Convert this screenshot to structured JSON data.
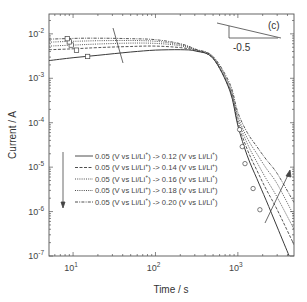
{
  "chart_data": {
    "type": "line",
    "panel_label": "(c)",
    "title": "",
    "xlabel": "Time / s",
    "ylabel": "Current / A",
    "xscale": "log",
    "yscale": "log",
    "xlim": [
      5.1,
      4800
    ],
    "ylim": [
      1e-07,
      0.028
    ],
    "grid": false,
    "x_ticks": [
      {
        "value": 10,
        "base": "10",
        "exp": "1"
      },
      {
        "value": 100,
        "base": "10",
        "exp": "2"
      },
      {
        "value": 1000,
        "base": "10",
        "exp": "3"
      }
    ],
    "y_ticks": [
      {
        "value": 0.01,
        "base": "10",
        "exp": "-2"
      },
      {
        "value": 0.001,
        "base": "10",
        "exp": "-3"
      },
      {
        "value": 0.0001,
        "base": "10",
        "exp": "-4"
      },
      {
        "value": 1e-05,
        "base": "10",
        "exp": "-5"
      },
      {
        "value": 1e-06,
        "base": "10",
        "exp": "-6"
      },
      {
        "value": 1e-07,
        "base": "10",
        "exp": "-7"
      }
    ],
    "slope_annotation": {
      "label": "-0.5"
    },
    "legend_position": "lower-left inside",
    "series": [
      {
        "name": "0.05 (V vs Li/Li+) -> 0.12 (V vs Li/Li+)",
        "style": "solid",
        "x": [
          5.1,
          10,
          20,
          50,
          100,
          200,
          310,
          500,
          800,
          1000,
          1300,
          1700,
          2200,
          3000,
          4200
        ],
        "y": [
          0.0025,
          0.0029,
          0.0033,
          0.0039,
          0.0043,
          0.0044,
          0.0041,
          0.0028,
          0.00052,
          8.5e-05,
          1.8e-05,
          5.5e-06,
          1.8e-06,
          4.5e-07,
          1e-07
        ],
        "marker_x": 15,
        "marker_y": 0.0031
      },
      {
        "name": "0.05 (V vs Li/Li+) -> 0.14 (V vs Li/Li+)",
        "style": "dashed",
        "x": [
          5.1,
          10,
          20,
          50,
          100,
          200,
          310,
          500,
          800,
          1000,
          1300,
          1700,
          2200,
          3000,
          4800
        ],
        "y": [
          0.0044,
          0.0046,
          0.0049,
          0.0052,
          0.0053,
          0.0049,
          0.0042,
          0.0028,
          0.00055,
          0.0001,
          2.5e-05,
          8.5e-06,
          3.2e-06,
          1.1e-06,
          1.8e-07
        ],
        "marker_x": 11,
        "marker_y": 0.0043
      },
      {
        "name": "0.05 (V vs Li/Li+) -> 0.16 (V vs Li/Li+)",
        "style": "dotted",
        "x": [
          5.1,
          10,
          20,
          50,
          100,
          200,
          310,
          500,
          800,
          1000,
          1300,
          1700,
          2200,
          3000,
          4800
        ],
        "y": [
          0.0053,
          0.0056,
          0.0059,
          0.0062,
          0.0061,
          0.0054,
          0.0043,
          0.0029,
          0.0006,
          0.00012,
          3.4e-05,
          1.3e-05,
          5.5e-06,
          2.1e-06,
          4e-07
        ],
        "marker_x": 9.5,
        "marker_y": 0.0056
      },
      {
        "name": "0.05 (V vs Li/Li+) -> 0.18 (V vs Li/Li+)",
        "style": "dotted",
        "x": [
          5.1,
          10,
          20,
          50,
          100,
          200,
          310,
          500,
          800,
          1000,
          1300,
          1700,
          2200,
          3000,
          4800
        ],
        "y": [
          0.0065,
          0.0068,
          0.007,
          0.0071,
          0.0068,
          0.0057,
          0.0044,
          0.003,
          0.00066,
          0.00014,
          4.5e-05,
          2e-05,
          9.5e-06,
          4.2e-06,
          8e-07
        ],
        "marker_x": 9,
        "marker_y": 0.0066
      },
      {
        "name": "0.05 (V vs Li/Li+) -> 0.20 (V vs Li/Li+)",
        "style": "dashdot",
        "x": [
          5.1,
          10,
          20,
          50,
          100,
          200,
          310,
          500,
          800,
          1000,
          1300,
          1700,
          2200,
          3000,
          4800
        ],
        "y": [
          0.0076,
          0.0079,
          0.008,
          0.0078,
          0.0074,
          0.006,
          0.0045,
          0.0031,
          0.00075,
          0.00017,
          6e-05,
          2.9e-05,
          1.5e-05,
          7.2e-06,
          1.6e-06
        ],
        "marker_x": 8.5,
        "marker_y": 0.0078
      }
    ],
    "tail_markers": [
      {
        "x": 1050,
        "y": 7e-05
      },
      {
        "x": 1130,
        "y": 2.9e-05
      },
      {
        "x": 1220,
        "y": 1.2e-05
      },
      {
        "x": 1530,
        "y": 3.3e-06
      },
      {
        "x": 1850,
        "y": 1.1e-06
      }
    ],
    "annotations": [
      {
        "type": "arrow",
        "meaning": "increasing final potential (legend order)",
        "direction": "down"
      },
      {
        "type": "arrow",
        "meaning": "increasing final potential (tail region)",
        "direction": "up-right"
      },
      {
        "type": "line",
        "meaning": "increasing final potential (plateau region)"
      }
    ]
  },
  "legend": {
    "entries": [
      {
        "from": "0.05 (V vs Li/Li",
        "sup": "+",
        "mid": ") -> 0.12 (V vs Li/Li",
        "sup2": "+",
        "end": ")"
      },
      {
        "from": "0.05 (V vs Li/Li",
        "sup": "+",
        "mid": ") -> 0.14 (V vs Li/Li",
        "sup2": "+",
        "end": ")"
      },
      {
        "from": "0.05 (V vs Li/Li",
        "sup": "+",
        "mid": ") -> 0.16 (V vs Li/Li",
        "sup2": "+",
        "end": ")"
      },
      {
        "from": "0.05 (V vs Li/Li",
        "sup": "+",
        "mid": ") -> 0.18 (V vs Li/Li",
        "sup2": "+",
        "end": ")"
      },
      {
        "from": "0.05 (V vs Li/Li",
        "sup": "+",
        "mid": ") -> 0.20 (V vs Li/Li",
        "sup2": "+",
        "end": ")"
      }
    ]
  },
  "colors": {
    "axis": "#555555",
    "line": "#3a3a3a",
    "text": "#333333",
    "background": "#ffffff"
  }
}
